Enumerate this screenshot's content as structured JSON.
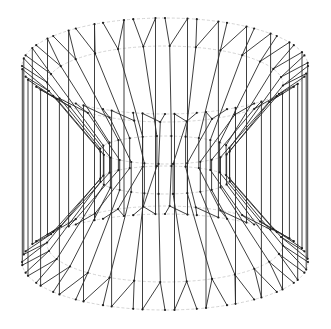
{
  "figure": {
    "type": "3d-wireframe",
    "width": 331,
    "height": 329,
    "background": "#ffffff",
    "edge_color": "#2a2a2a",
    "guide_color": "#c8c8c8",
    "center_x": 165,
    "strip_count": 28,
    "twist_shift": 0.11,
    "outer": {
      "rx": 143,
      "top_y": 66,
      "bottom_y": 262,
      "ry": 48
    },
    "inner": {
      "rx": 118,
      "top_y": 84,
      "bottom_y": 244,
      "ry": 38
    },
    "mid_inner": {
      "rx": 65,
      "top_y": 150,
      "bottom_y": 180,
      "ry": 14
    }
  }
}
